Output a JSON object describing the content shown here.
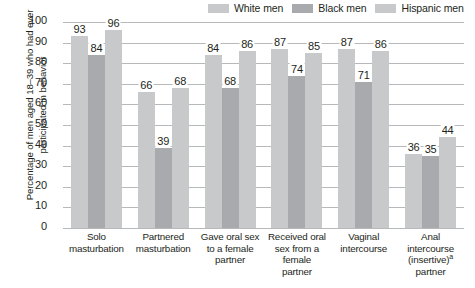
{
  "chart_data": {
    "type": "bar",
    "title": "",
    "xlabel": "",
    "ylabel": "Percentage of men aged 18–39 who had ever participated in behavior",
    "ylim": [
      0,
      100
    ],
    "yticks": [
      0,
      10,
      20,
      30,
      40,
      50,
      60,
      70,
      80,
      90,
      100
    ],
    "grid": true,
    "legend_position": "top-right",
    "categories": [
      "Solo masturbation",
      "Partnered masturbation",
      "Gave oral sex to a female partner",
      "Received oral sex from a female partner",
      "Vaginal intercourse",
      "Anal intercourse (insertive)ᵃ partner"
    ],
    "series": [
      {
        "name": "White men",
        "color": "#c8c9ca",
        "values": [
          93,
          66,
          84,
          87,
          87,
          36
        ]
      },
      {
        "name": "Black men",
        "color": "#a8aaad",
        "values": [
          84,
          39,
          68,
          74,
          71,
          35
        ]
      },
      {
        "name": "Hispanic men",
        "color": "#c8c9ca",
        "values": [
          96,
          68,
          86,
          85,
          86,
          44
        ]
      }
    ]
  },
  "legend": {
    "items": [
      {
        "label": "White men",
        "color": "#c8c9ca"
      },
      {
        "label": "Black men",
        "color": "#a8aaad"
      },
      {
        "label": "Hispanic men",
        "color": "#c8c9ca"
      }
    ]
  },
  "axis": {
    "y_title": "Percentage of men aged 18–39 who had ever participated in behavior",
    "y_ticks": [
      "100",
      "90",
      "80",
      "70",
      "60",
      "50",
      "40",
      "30",
      "20",
      "10",
      "0"
    ]
  },
  "x_labels": [
    {
      "line1": "Solo",
      "line2": "masturbation",
      "line3": "",
      "line4": ""
    },
    {
      "line1": "Partnered",
      "line2": "masturbation",
      "line3": "",
      "line4": ""
    },
    {
      "line1": "Gave oral sex",
      "line2": "to a female",
      "line3": "partner",
      "line4": ""
    },
    {
      "line1": "Received oral",
      "line2": "sex from a",
      "line3": "female",
      "line4": "partner"
    },
    {
      "line1": "Vaginal",
      "line2": "intercourse",
      "line3": "",
      "line4": ""
    },
    {
      "line1": "Anal",
      "line2": "intercourse",
      "line3": "(insertive)",
      "line4": "partner",
      "superscript": "a"
    }
  ]
}
